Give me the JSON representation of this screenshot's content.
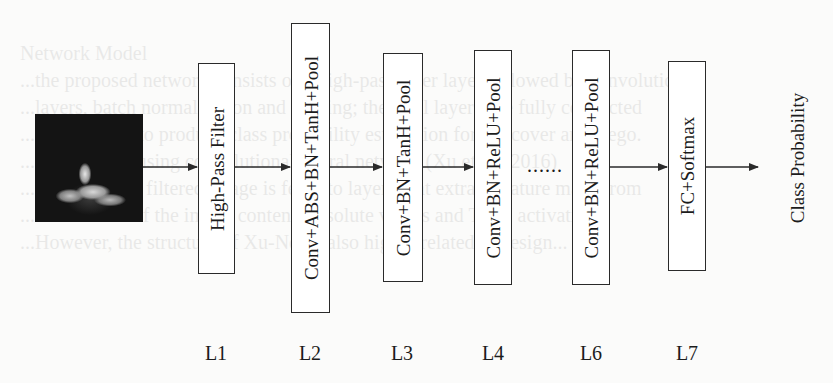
{
  "diagram": {
    "title": "",
    "input": {
      "label": "input-image",
      "description": "grayscale image of a plant on dark background"
    },
    "layers": [
      {
        "id": "L1",
        "label": "L1",
        "text": "High-Pass Filter"
      },
      {
        "id": "L2",
        "label": "L2",
        "text": "Conv+ABS+BN+TanH+Pool"
      },
      {
        "id": "L3",
        "label": "L3",
        "text": "Conv+BN+TanH+Pool"
      },
      {
        "id": "L4",
        "label": "L4",
        "text": "Conv+BN+ReLU+Pool"
      },
      {
        "id": "L6",
        "label": "L6",
        "text": "Conv+BN+ReLU+Pool"
      },
      {
        "id": "L7",
        "label": "L7",
        "text": "FC+Softmax"
      }
    ],
    "ellipsis": "......",
    "output": {
      "text": "Class Probability"
    },
    "colors": {
      "stroke": "#2a2a2a",
      "background": "#fbfbfa",
      "box_fill": "#ffffff"
    }
  },
  "background_bleed": {
    "lines": [
      "",
      "                                        Network Model",
      "  ...the proposed network consists of a high-pass filter layer followed by convolutional",
      "  ...layers, batch normalization and pooling; the final layers use fully connected",
      "  ...and softmax to produce class probability estimation for the cover and stego.",
      "  ...steganalysis using convolutional neural network (Xu et al., 2016)",
      "  ...the high-pass filtered image is fed into layers that extract feature maps from",
      "  ...the residual of the image content; absolute values and TanH activations",
      "  ...However, the structure of Xu-Net is also highly related to design..."
    ]
  }
}
